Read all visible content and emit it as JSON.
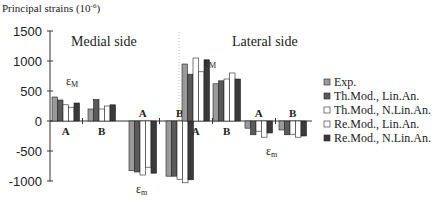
{
  "chart_data": {
    "type": "bar",
    "title": "",
    "ylabel": "Principal strains (10^-6)",
    "ylabel_display": "Principal strains (10",
    "ylabel_exp": "-6",
    "xlabel": "",
    "ylim": [
      -1000,
      1500
    ],
    "yticks": [
      1500,
      1000,
      500,
      0,
      -500,
      -1000
    ],
    "grid": false,
    "legend_position": "right",
    "sections": [
      {
        "label": "Medial side"
      },
      {
        "label": "Lateral side"
      }
    ],
    "annotations": [
      "εM",
      "εm",
      "εM",
      "εm"
    ],
    "categories": [
      "Medial εM A",
      "Medial εM B",
      "Medial εm A",
      "Medial εm B",
      "Lateral εM A",
      "Lateral εM B",
      "Lateral εm A",
      "Lateral εm B"
    ],
    "group_labels": [
      "A",
      "B",
      "A",
      "B",
      "A",
      "B",
      "A",
      "B"
    ],
    "series": [
      {
        "name": "Exp.",
        "color": "#9a9a9a",
        "values": [
          400,
          200,
          -830,
          -920,
          950,
          620,
          -120,
          -150
        ]
      },
      {
        "name": "Th.Mod., Lin.An.",
        "color": "#5a5a5a",
        "values": [
          350,
          360,
          -850,
          -920,
          780,
          670,
          -230,
          -230
        ]
      },
      {
        "name": "Th.Mod., N.Lin.An.",
        "color": "#ffffff",
        "values": [
          270,
          200,
          -900,
          -970,
          1050,
          700,
          -170,
          -220
        ]
      },
      {
        "name": "Re.Mod., Lin.An.",
        "color": "#ffffff",
        "values": [
          230,
          250,
          -770,
          -1030,
          820,
          800,
          -270,
          -270
        ]
      },
      {
        "name": "Re.Mod., N.Lin.An.",
        "color": "#3a3a3a",
        "values": [
          300,
          270,
          -870,
          -980,
          1020,
          700,
          -200,
          -250
        ]
      }
    ]
  }
}
